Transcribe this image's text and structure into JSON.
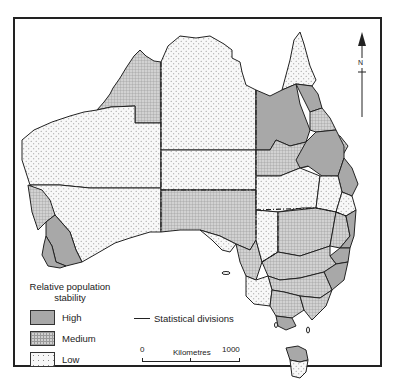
{
  "map": {
    "subject": "Australia",
    "colors": {
      "high": "#a8a8a8",
      "medium": "#cfcfcf",
      "low": "#f7f7f7",
      "outline": "#222222"
    },
    "legend": {
      "title": "Relative population stability",
      "items": [
        {
          "key": "high",
          "label": "High"
        },
        {
          "key": "medium",
          "label": "Medium"
        },
        {
          "key": "low",
          "label": "Low"
        }
      ]
    },
    "divisions_key": {
      "label": "Statistical divisions"
    },
    "scale": {
      "zero": "0",
      "units": "Kilometres",
      "max": "1000"
    },
    "north": {
      "label": "N"
    }
  }
}
